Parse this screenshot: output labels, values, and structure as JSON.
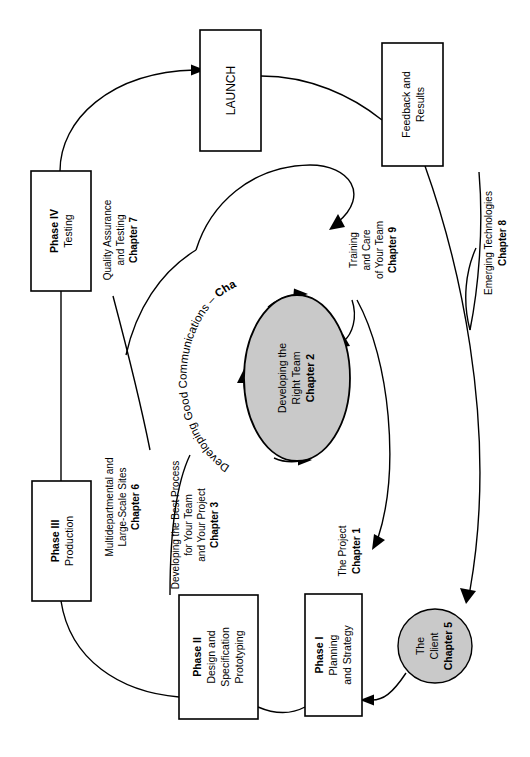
{
  "diagram": {
    "orientation": "rotated-90-ccw",
    "colors": {
      "fill_gray": "#c9c9c9",
      "stroke": "#000000",
      "background": "#ffffff"
    },
    "nodes": [
      {
        "id": "launch",
        "shape": "rect",
        "lines": [
          "LAUNCH"
        ],
        "bold": [
          true
        ]
      },
      {
        "id": "feedback",
        "shape": "rect",
        "lines": [
          "Feedback and",
          "Results"
        ],
        "bold": [
          false,
          false
        ]
      },
      {
        "id": "phase4",
        "shape": "rect",
        "lines": [
          "Phase IV",
          "Testing"
        ],
        "bold": [
          true,
          false
        ]
      },
      {
        "id": "phase3",
        "shape": "rect",
        "lines": [
          "Phase III",
          "Production"
        ],
        "bold": [
          true,
          false
        ]
      },
      {
        "id": "phase2",
        "shape": "rect",
        "lines": [
          "Phase II",
          "Design and",
          "Specification",
          "Prototyping"
        ],
        "bold": [
          true,
          false,
          false,
          false
        ]
      },
      {
        "id": "phase1",
        "shape": "rect",
        "lines": [
          "Phase I",
          "Planning",
          "and Strategy"
        ],
        "bold": [
          true,
          false,
          false
        ]
      },
      {
        "id": "client",
        "shape": "circle",
        "lines": [
          "The",
          "Client",
          "Chapter 5"
        ],
        "bold": [
          false,
          false,
          true
        ]
      },
      {
        "id": "team",
        "shape": "ellipse",
        "lines": [
          "Developing the",
          "Right Team",
          "Chapter 2"
        ],
        "bold": [
          false,
          false,
          true
        ]
      }
    ],
    "labels": [
      {
        "id": "chapter7",
        "lines": [
          "Quality Assurance",
          "and Testing",
          "Chapter 7"
        ],
        "bold": [
          false,
          false,
          true
        ]
      },
      {
        "id": "chapter6",
        "lines": [
          "Multidepartmental and",
          "Large-Scale Sites",
          "Chapter 6"
        ],
        "bold": [
          false,
          false,
          true
        ]
      },
      {
        "id": "chapter3",
        "lines": [
          "Developing the Best Process",
          "for Your Team",
          "and Your Project",
          "Chapter 3"
        ],
        "bold": [
          false,
          false,
          false,
          true
        ]
      },
      {
        "id": "chapter9",
        "lines": [
          "Training",
          "and Care",
          "of Your Team",
          "Chapter 9"
        ],
        "bold": [
          false,
          false,
          false,
          true
        ]
      },
      {
        "id": "chapter8",
        "lines": [
          "Emerging Technologies",
          "Chapter 8"
        ],
        "bold": [
          false,
          true
        ]
      },
      {
        "id": "chapter1",
        "lines": [
          "The Project",
          "Chapter 1"
        ],
        "bold": [
          false,
          true
        ]
      },
      {
        "id": "chapter4",
        "text_normal": "Developing Good Communications – ",
        "text_bold": "Chapter 4",
        "curved": true
      }
    ]
  }
}
